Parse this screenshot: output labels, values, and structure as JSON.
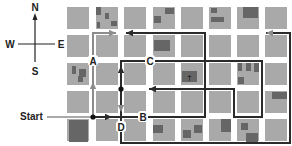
{
  "colors": {
    "background": "#ffffff",
    "block": "#a9a9a9",
    "building": "#666666",
    "dark_path": "#2b2b2b",
    "gray_path": "#8c8c8c",
    "label": "#222222"
  },
  "compass": {
    "north": "N",
    "south": "S",
    "west": "W",
    "east": "E"
  },
  "start": {
    "label": "Start"
  },
  "points": {
    "A": {
      "label": "A",
      "x": 93,
      "y": 61
    },
    "B": {
      "label": "B",
      "x": 143,
      "y": 117
    },
    "C": {
      "label": "C",
      "x": 150,
      "y": 61
    },
    "D": {
      "label": "D",
      "x": 121,
      "y": 127
    }
  },
  "grid": {
    "cols_x": [
      67,
      96,
      124,
      153,
      181,
      209,
      237,
      265
    ],
    "rows_y": [
      7,
      35,
      63,
      91,
      119
    ],
    "block_w": 22,
    "block_h": 22
  },
  "buildings": [
    [
      96,
      7,
      5,
      8
    ],
    [
      105,
      13,
      4,
      6
    ],
    [
      111,
      21,
      6,
      5
    ],
    [
      97,
      22,
      3,
      6
    ],
    [
      154,
      16,
      7,
      7
    ],
    [
      165,
      8,
      9,
      6
    ],
    [
      211,
      8,
      6,
      5
    ],
    [
      211,
      17,
      13,
      5
    ],
    [
      243,
      7,
      15,
      11
    ],
    [
      154,
      40,
      16,
      11
    ],
    [
      72,
      66,
      4,
      8
    ],
    [
      79,
      69,
      7,
      8
    ],
    [
      78,
      76,
      5,
      6
    ],
    [
      182,
      71,
      15,
      11
    ],
    [
      238,
      63,
      4,
      8
    ],
    [
      246,
      63,
      5,
      8
    ],
    [
      254,
      63,
      5,
      9
    ],
    [
      238,
      77,
      6,
      7
    ],
    [
      272,
      92,
      15,
      7
    ],
    [
      69,
      120,
      19,
      22
    ],
    [
      153,
      125,
      10,
      8
    ],
    [
      183,
      130,
      8,
      8
    ],
    [
      194,
      125,
      8,
      8
    ],
    [
      221,
      119,
      10,
      13
    ],
    [
      241,
      123,
      7,
      7
    ],
    [
      246,
      133,
      12,
      9
    ]
  ],
  "church_symbol": "†",
  "routes": [
    {
      "name": "gray-route-north",
      "color": "gray",
      "points": [
        [
          93,
          117
        ],
        [
          93,
          33
        ],
        [
          116,
          33
        ]
      ],
      "arrow": "east"
    },
    {
      "name": "dark-route-east-loop",
      "color": "dark",
      "points": [
        [
          93,
          117
        ],
        [
          205,
          117
        ],
        [
          205,
          33
        ],
        [
          126,
          33
        ]
      ],
      "arrow": "west"
    },
    {
      "name": "dark-route-c-loop",
      "color": "dark",
      "points": [
        [
          121,
          89
        ],
        [
          121,
          61
        ],
        [
          262,
          61
        ],
        [
          262,
          117
        ],
        [
          234,
          117
        ],
        [
          234,
          89
        ],
        [
          149,
          89
        ]
      ],
      "arrow": "west"
    },
    {
      "name": "gray-route-south-loop",
      "color": "dark",
      "points": [
        [
          121,
          89
        ],
        [
          121,
          143
        ],
        [
          290,
          143
        ],
        [
          290,
          33
        ],
        [
          266,
          33
        ]
      ],
      "arrow": "west"
    }
  ],
  "arrowheads": [
    {
      "x": 116,
      "y": 33,
      "dir": "east",
      "color": "gray"
    },
    {
      "x": 93,
      "y": 82,
      "dir": "north",
      "color": "gray"
    },
    {
      "x": 112,
      "y": 117,
      "dir": "east",
      "color": "dark"
    },
    {
      "x": 121,
      "y": 66,
      "dir": "north",
      "color": "dark"
    },
    {
      "x": 121,
      "y": 112,
      "dir": "south",
      "color": "gray"
    },
    {
      "x": 126,
      "y": 33,
      "dir": "west",
      "color": "dark"
    },
    {
      "x": 149,
      "y": 89,
      "dir": "west",
      "color": "dark"
    },
    {
      "x": 266,
      "y": 33,
      "dir": "west",
      "color": "gray"
    }
  ],
  "dots": [
    [
      93,
      117
    ],
    [
      121,
      89
    ]
  ]
}
